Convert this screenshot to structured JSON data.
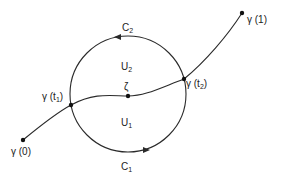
{
  "diagram": {
    "title": "",
    "stroke_color": "#2a2a2a",
    "circle": {
      "cx": 128,
      "cy": 94,
      "r": 58
    },
    "points": {
      "gamma0": {
        "x": 23,
        "y": 140,
        "label": "γ (0)"
      },
      "gamma1": {
        "x": 242,
        "y": 13,
        "label": "γ (1)"
      },
      "gamma_t1": {
        "x": 71,
        "y": 105,
        "label": "γ (t",
        "sub": "1",
        "close": ")"
      },
      "gamma_t2": {
        "x": 184,
        "y": 79,
        "label": "γ (t",
        "sub": "2",
        "close": ")"
      },
      "zeta": {
        "x": 128,
        "y": 96,
        "label": "ζ"
      }
    },
    "regions": {
      "U2": {
        "label": "U",
        "sub": "2"
      },
      "U1": {
        "label": "U",
        "sub": "1"
      }
    },
    "arcs": {
      "C2": {
        "label": "C",
        "sub": "2"
      },
      "C1": {
        "label": "C",
        "sub": "1"
      }
    }
  }
}
